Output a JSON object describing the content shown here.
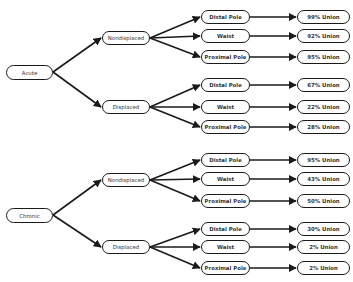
{
  "diagram": {
    "type": "decision-tree",
    "roots": [
      {
        "label": "Acute",
        "branches": [
          {
            "label": "Nondisplaced",
            "locations": [
              {
                "label": "Distal Pole",
                "outcome": "99% Union"
              },
              {
                "label": "Waist",
                "outcome": "92% Union"
              },
              {
                "label": "Proximal Pole",
                "outcome": "95% Union"
              }
            ]
          },
          {
            "label": "Displaced",
            "locations": [
              {
                "label": "Distal Pole",
                "outcome": "67% Union"
              },
              {
                "label": "Waist",
                "outcome": "22% Union"
              },
              {
                "label": "Proximal Pole",
                "outcome": "28% Union"
              }
            ]
          }
        ]
      },
      {
        "label": "Chronic",
        "branches": [
          {
            "label": "Nondisplaced",
            "locations": [
              {
                "label": "Distal Pole",
                "outcome": "95% Union"
              },
              {
                "label": "Waist",
                "outcome": "43% Union"
              },
              {
                "label": "Proximal Pole",
                "outcome": "50% Union"
              }
            ]
          },
          {
            "label": "Displaced",
            "locations": [
              {
                "label": "Distal Pole",
                "outcome": "30% Union"
              },
              {
                "label": "Waist",
                "outcome": "2% Union"
              },
              {
                "label": "Proximal Pole",
                "outcome": "2% Union"
              }
            ]
          }
        ]
      }
    ]
  },
  "colors": {
    "stroke": "#1a1a1a",
    "text": "#333333",
    "background": "#ffffff"
  }
}
